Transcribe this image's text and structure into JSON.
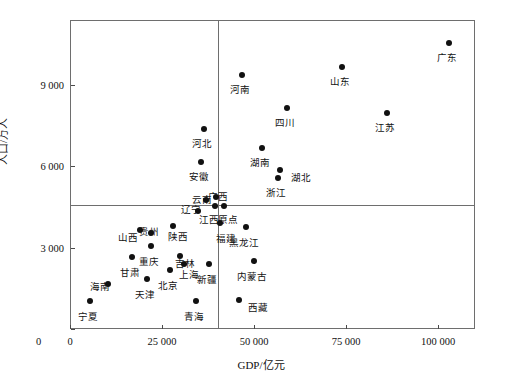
{
  "chart_data": {
    "type": "scatter",
    "title": "",
    "xlabel": "GDP/亿元",
    "ylabel": "人口/万人",
    "xlim": [
      0,
      110000
    ],
    "ylim": [
      0,
      11400
    ],
    "xticks": [
      0,
      25000,
      50000,
      75000,
      100000
    ],
    "xticklabels": [
      "0",
      "25 000",
      "50 000",
      "75 000",
      "100 000"
    ],
    "yticks": [
      0,
      3000,
      6000,
      9000
    ],
    "yticklabels": [
      "0",
      "3 000",
      "6 000",
      "9 000"
    ],
    "grid": false,
    "legend": null,
    "reference_lines": {
      "vertical_mean_gdp": 39900,
      "horizontal_mean_population": 4630
    },
    "points": [
      {
        "name": "广东",
        "x": 102800,
        "y": 10600,
        "label_dx": -2,
        "label_dy": 10
      },
      {
        "name": "山东",
        "x": 73500,
        "y": 9700,
        "label_dx": -2,
        "label_dy": 10
      },
      {
        "name": "江苏",
        "x": 85700,
        "y": 8000,
        "label_dx": -2,
        "label_dy": 10
      },
      {
        "name": "河南",
        "x": 46500,
        "y": 9400,
        "label_dx": -2,
        "label_dy": 10
      },
      {
        "name": "四川",
        "x": 58800,
        "y": 8200,
        "label_dx": -2,
        "label_dy": 10
      },
      {
        "name": "河北",
        "x": 36000,
        "y": 7400,
        "label_dx": -2,
        "label_dy": 10
      },
      {
        "name": "湖南",
        "x": 52000,
        "y": 6700,
        "label_dx": -2,
        "label_dy": 10
      },
      {
        "name": "湖北",
        "x": 56800,
        "y": 5900,
        "label_dx": 11,
        "label_dy": 3
      },
      {
        "name": "安徽",
        "x": 35200,
        "y": 6200,
        "label_dx": -2,
        "label_dy": 10
      },
      {
        "name": "浙江",
        "x": 56200,
        "y": 5600,
        "label_dx": -2,
        "label_dy": 10
      },
      {
        "name": "云南",
        "x": 36800,
        "y": 4800,
        "label_dx": -14,
        "label_dy": -5
      },
      {
        "name": "广西",
        "x": 39500,
        "y": 4900,
        "label_dx": 2,
        "label_dy": -5
      },
      {
        "name": "辽宁",
        "x": 34500,
        "y": 4380,
        "label_dx": -17,
        "label_dy": -6
      },
      {
        "name": "江西",
        "x": 39000,
        "y": 4580,
        "label_dx": -16,
        "label_dy": 9
      },
      {
        "name": "原点",
        "x": 41500,
        "y": 4560,
        "label_dx": 4,
        "label_dy": 9
      },
      {
        "name": "福建",
        "x": 40500,
        "y": 3930,
        "label_dx": -4,
        "label_dy": 11
      },
      {
        "name": "黑龙江",
        "x": 47500,
        "y": 3800,
        "label_dx": -2,
        "label_dy": 11
      },
      {
        "name": "贵州",
        "x": 21600,
        "y": 3580,
        "label_dx": -2,
        "label_dy": -6
      },
      {
        "name": "山西",
        "x": 18800,
        "y": 3700,
        "label_dx": -22,
        "label_dy": 3
      },
      {
        "name": "陕西",
        "x": 27800,
        "y": 3840,
        "label_dx": 5,
        "label_dy": 6
      },
      {
        "name": "重庆",
        "x": 21800,
        "y": 3100,
        "label_dx": -2,
        "label_dy": 11
      },
      {
        "name": "吉林",
        "x": 29500,
        "y": 2730,
        "label_dx": 5,
        "label_dy": 3
      },
      {
        "name": "甘肃",
        "x": 16700,
        "y": 2680,
        "label_dx": -2,
        "label_dy": 11
      },
      {
        "name": "上海",
        "x": 30800,
        "y": 2420,
        "label_dx": 5,
        "label_dy": 6
      },
      {
        "name": "北京",
        "x": 27000,
        "y": 2200,
        "label_dx": -2,
        "label_dy": 11
      },
      {
        "name": "新疆",
        "x": 37500,
        "y": 2450,
        "label_dx": -2,
        "label_dy": 11
      },
      {
        "name": "内蒙古",
        "x": 49700,
        "y": 2540,
        "label_dx": -2,
        "label_dy": 11
      },
      {
        "name": "海南",
        "x": 10000,
        "y": 1700,
        "label_dx": -18,
        "label_dy": -2
      },
      {
        "name": "天津",
        "x": 20600,
        "y": 1900,
        "label_dx": -2,
        "label_dy": 11
      },
      {
        "name": "宁夏",
        "x": 5200,
        "y": 1060,
        "label_dx": -2,
        "label_dy": 11
      },
      {
        "name": "青海",
        "x": 34000,
        "y": 1080,
        "label_dx": -2,
        "label_dy": 11
      },
      {
        "name": "西藏",
        "x": 45500,
        "y": 1120,
        "label_dx": 9,
        "label_dy": 3
      }
    ]
  }
}
